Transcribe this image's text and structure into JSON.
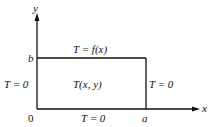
{
  "diagram": {
    "axes": {
      "x_label": "x",
      "y_label": "y",
      "origin_label": "0",
      "x_extent_label": "a",
      "y_extent_label": "b"
    },
    "boundaries": {
      "top": "T = f(x)",
      "left": "T = 0",
      "right": "T = 0",
      "bottom": "T = 0"
    },
    "interior_label": "T(x, y)",
    "colors": {
      "line": "#111111",
      "background": "#ffffff"
    }
  }
}
